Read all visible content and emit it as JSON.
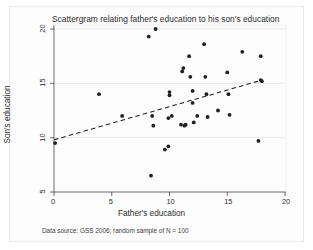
{
  "figure": {
    "title": "Scattergram relating father's education to his son's education",
    "source_note": "Data source: GSS 2006; random sample of N = 100",
    "background_color": "#ffffff",
    "panel_color": "#ffffff",
    "marker_color": "#231f20",
    "fit_line_color": "#231f20",
    "gridline_color": "#e3e3e3",
    "axis_color": "#5a5a5a"
  },
  "chart_data": {
    "type": "scatter",
    "title": "Scattergram relating father's education to his son's education",
    "xlabel": "Father's education",
    "ylabel": "Son's education",
    "xlim": [
      0,
      20
    ],
    "ylim": [
      5,
      20
    ],
    "xticks": [
      0,
      5,
      10,
      15,
      20
    ],
    "yticks": [
      5,
      10,
      15,
      20
    ],
    "xtick_labels": [
      "0",
      "5",
      "10",
      "15",
      "20"
    ],
    "ytick_labels": [
      "5",
      "10",
      "15",
      "20"
    ],
    "grid": "horizontal",
    "legend": "none",
    "annotation": "Data source: GSS 2006; random sample of N = 100",
    "points": [
      {
        "x": 0.1,
        "y": 9.5
      },
      {
        "x": 3.9,
        "y": 14.0
      },
      {
        "x": 5.9,
        "y": 12.0
      },
      {
        "x": 8.2,
        "y": 19.3
      },
      {
        "x": 8.8,
        "y": 20.0
      },
      {
        "x": 8.4,
        "y": 6.5
      },
      {
        "x": 8.5,
        "y": 12.0
      },
      {
        "x": 8.6,
        "y": 11.1
      },
      {
        "x": 9.6,
        "y": 8.9
      },
      {
        "x": 9.9,
        "y": 9.2
      },
      {
        "x": 9.9,
        "y": 11.8
      },
      {
        "x": 10.0,
        "y": 14.2
      },
      {
        "x": 10.0,
        "y": 13.9
      },
      {
        "x": 10.2,
        "y": 12.0
      },
      {
        "x": 11.1,
        "y": 16.1
      },
      {
        "x": 11.2,
        "y": 16.4
      },
      {
        "x": 11.0,
        "y": 11.2
      },
      {
        "x": 11.3,
        "y": 11.1
      },
      {
        "x": 11.4,
        "y": 11.2
      },
      {
        "x": 11.7,
        "y": 17.5
      },
      {
        "x": 11.8,
        "y": 15.6
      },
      {
        "x": 12.0,
        "y": 14.3
      },
      {
        "x": 12.0,
        "y": 13.2
      },
      {
        "x": 12.1,
        "y": 11.4
      },
      {
        "x": 12.4,
        "y": 12.0
      },
      {
        "x": 13.0,
        "y": 18.6
      },
      {
        "x": 13.1,
        "y": 15.6
      },
      {
        "x": 13.2,
        "y": 14.0
      },
      {
        "x": 13.3,
        "y": 11.9
      },
      {
        "x": 14.2,
        "y": 12.5
      },
      {
        "x": 15.0,
        "y": 16.0
      },
      {
        "x": 15.1,
        "y": 14.0
      },
      {
        "x": 15.2,
        "y": 12.1
      },
      {
        "x": 16.3,
        "y": 17.9
      },
      {
        "x": 17.7,
        "y": 9.7
      },
      {
        "x": 17.9,
        "y": 17.5
      },
      {
        "x": 17.9,
        "y": 15.3
      },
      {
        "x": 18.0,
        "y": 15.2
      }
    ],
    "fit_line": {
      "style": "dashed",
      "x_start": 0.0,
      "y_start": 9.8,
      "x_end": 18.0,
      "y_end": 15.3
    }
  }
}
